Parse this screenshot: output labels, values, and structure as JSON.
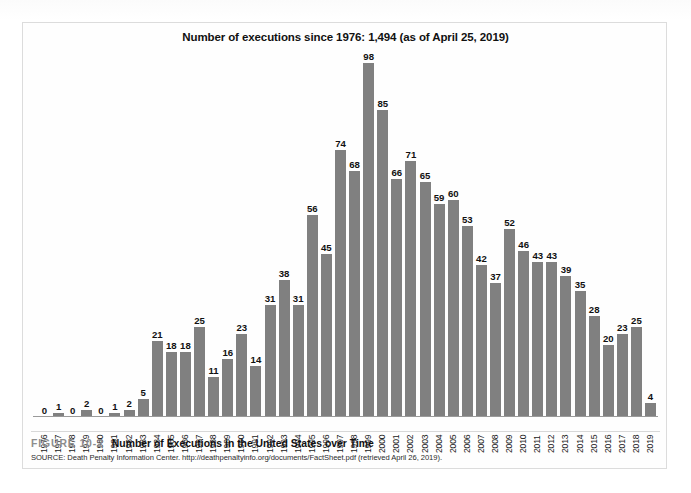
{
  "figure": {
    "number_label": "FIGURE 10-2",
    "caption_title": "Number of Executions in the United States over Time",
    "source": "SOURCE: Death Penalty Information Center. http://deathpenaltyinfo.org/documents/FactSheet.pdf (retrieved April 26, 2019)."
  },
  "chart_data": {
    "type": "bar",
    "title": "Number of executions since 1976: 1,494 (as of April 25, 2019)",
    "xlabel": "",
    "ylabel": "",
    "ylim": [
      0,
      98
    ],
    "grid": false,
    "legend": false,
    "bar_color": "#808080",
    "data_labels": true,
    "categories": [
      "1976",
      "1977",
      "1978",
      "1979",
      "1980",
      "1981",
      "1982",
      "1983",
      "1984",
      "1985",
      "1986",
      "1987",
      "1988",
      "1989",
      "1990",
      "1991",
      "1992",
      "1993",
      "1994",
      "1995",
      "1996",
      "1997",
      "1998",
      "1999",
      "2000",
      "2001",
      "2002",
      "2003",
      "2004",
      "2005",
      "2006",
      "2007",
      "2008",
      "2009",
      "2010",
      "2011",
      "2012",
      "2013",
      "2014",
      "2015",
      "2016",
      "2017",
      "2018",
      "2019"
    ],
    "values": [
      0,
      1,
      0,
      2,
      0,
      1,
      2,
      5,
      21,
      18,
      18,
      25,
      11,
      16,
      23,
      14,
      31,
      38,
      31,
      56,
      45,
      74,
      68,
      98,
      85,
      66,
      71,
      65,
      59,
      60,
      53,
      42,
      37,
      52,
      46,
      43,
      43,
      39,
      35,
      28,
      20,
      23,
      25,
      4
    ],
    "total": 1494,
    "as_of": "April 25, 2019"
  }
}
